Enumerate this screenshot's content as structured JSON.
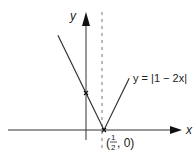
{
  "chart_data": {
    "type": "line",
    "title": "",
    "xlabel": "x",
    "ylabel": "y",
    "xlim": [
      -1.05,
      2.25
    ],
    "ylim": [
      -0.45,
      3.5
    ],
    "grid": false,
    "series": [
      {
        "name": "y = |1 − 2x|",
        "function": "abs(1 - 2x)",
        "x": [
          -0.78,
          0,
          0.5,
          1.2
        ],
        "y": [
          2.56,
          1,
          0,
          1.4
        ]
      }
    ],
    "asymptote_line": {
      "x": 0.5,
      "style": "dashed"
    },
    "marked_points": [
      {
        "x": 0,
        "y": 1,
        "label": ""
      },
      {
        "x": 0.5,
        "y": 0,
        "label": "(½, 0)"
      }
    ],
    "annotations": {
      "curve_label": "y = |1 − 2x|",
      "vertex_label_prefix": "(",
      "vertex_label_num": "1",
      "vertex_label_den": "2",
      "vertex_label_suffix": ", 0)"
    },
    "axis_labels": {
      "x": "x",
      "y": "y"
    }
  }
}
